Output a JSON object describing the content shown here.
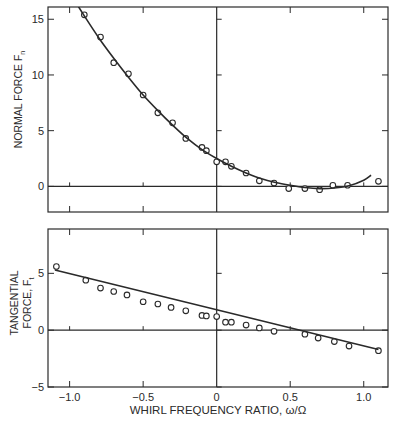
{
  "figure": {
    "xlabel": "WHIRL FREQUENCY RATIO, ω/Ω",
    "x_ticks": [
      -1.0,
      -0.5,
      0,
      0.5,
      1.0
    ],
    "x_tick_labels": [
      "−1.0",
      "−0.5",
      "0",
      "0.5",
      "1.0"
    ]
  },
  "chart_data": [
    {
      "type": "scatter",
      "title": "",
      "ylabel": "NORMAL FORCE F",
      "ylabel_subscript": "n",
      "xlabel": "",
      "xlim": [
        -1.147,
        1.165
      ],
      "ylim": [
        -2.3,
        16.1
      ],
      "y_ticks": [
        0,
        5,
        10,
        15
      ],
      "y_tick_labels": [
        "0",
        "5",
        "10",
        "15"
      ],
      "grid": false,
      "zero_lines": {
        "x": true,
        "y": true
      },
      "series": [
        {
          "name": "measured",
          "marker": "open-circle",
          "x": [
            -0.9,
            -0.79,
            -0.7,
            -0.6,
            -0.5,
            -0.4,
            -0.3,
            -0.21,
            -0.1,
            -0.07,
            0.0,
            0.06,
            0.1,
            0.2,
            0.29,
            0.39,
            0.49,
            0.6,
            0.7,
            0.79,
            0.89,
            1.1
          ],
          "y": [
            15.4,
            13.4,
            11.1,
            10.1,
            8.2,
            6.6,
            5.7,
            4.3,
            3.5,
            3.2,
            2.2,
            2.2,
            1.8,
            1.2,
            0.5,
            0.3,
            -0.2,
            -0.2,
            -0.3,
            0.1,
            0.1,
            0.45
          ]
        },
        {
          "name": "fit",
          "style": "line",
          "x": [
            -1.0,
            -0.9,
            -0.8,
            -0.7,
            -0.6,
            -0.5,
            -0.4,
            -0.3,
            -0.2,
            -0.1,
            0.0,
            0.1,
            0.2,
            0.3,
            0.4,
            0.5,
            0.6,
            0.7,
            0.8,
            0.9,
            1.0,
            1.05
          ],
          "y": [
            17.4,
            15.3,
            13.3,
            11.5,
            9.8,
            8.2,
            6.8,
            5.5,
            4.3,
            3.3,
            2.5,
            1.8,
            1.2,
            0.7,
            0.35,
            0.1,
            -0.1,
            -0.2,
            -0.15,
            0.05,
            0.55,
            1.0
          ]
        }
      ]
    },
    {
      "type": "scatter",
      "title": "",
      "ylabel": "TANGENTIAL FORCE, F",
      "ylabel_line1": "TANGENTIAL",
      "ylabel_line2": "FORCE, F",
      "ylabel_subscript": "t",
      "xlabel": "WHIRL FREQUENCY RATIO, ω/Ω",
      "xlim": [
        -1.147,
        1.165
      ],
      "ylim": [
        -5,
        8.9
      ],
      "y_ticks": [
        -5,
        0,
        5
      ],
      "y_tick_labels": [
        "−5",
        "0",
        "5"
      ],
      "grid": false,
      "zero_lines": {
        "x": true,
        "y": true
      },
      "series": [
        {
          "name": "measured",
          "marker": "open-circle",
          "x": [
            -1.09,
            -0.89,
            -0.79,
            -0.7,
            -0.61,
            -0.5,
            -0.4,
            -0.31,
            -0.21,
            -0.1,
            -0.07,
            0.0,
            0.06,
            0.1,
            0.2,
            0.29,
            0.39,
            0.6,
            0.69,
            0.8,
            0.9,
            1.1
          ],
          "y": [
            5.6,
            4.4,
            3.7,
            3.4,
            3.1,
            2.5,
            2.3,
            2.0,
            1.7,
            1.3,
            1.25,
            1.2,
            0.7,
            0.7,
            0.45,
            0.2,
            -0.1,
            -0.35,
            -0.7,
            -1.0,
            -1.4,
            -1.8
          ]
        },
        {
          "name": "fit",
          "style": "line",
          "x": [
            -1.1,
            1.1
          ],
          "y": [
            5.3,
            -1.7
          ]
        }
      ]
    }
  ]
}
